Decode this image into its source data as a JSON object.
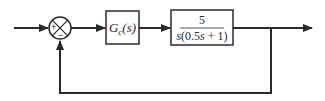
{
  "diagram": {
    "type": "feedback-control-block-diagram",
    "summing_junction": {
      "signs": {
        "reference_input": "+",
        "feedback_input": "−"
      }
    },
    "blocks": [
      {
        "id": "controller",
        "label_main": "G",
        "label_sub": "c",
        "label_arg": "(s)"
      },
      {
        "id": "plant",
        "numerator": "5",
        "denominator_prefix": "s",
        "denominator_body": "(0.5",
        "denominator_s": "s",
        "denominator_suffix": " + 1)"
      }
    ],
    "feedback": "unity",
    "colors": {
      "line": "#2a2a2a",
      "background": "#ffffff"
    }
  }
}
